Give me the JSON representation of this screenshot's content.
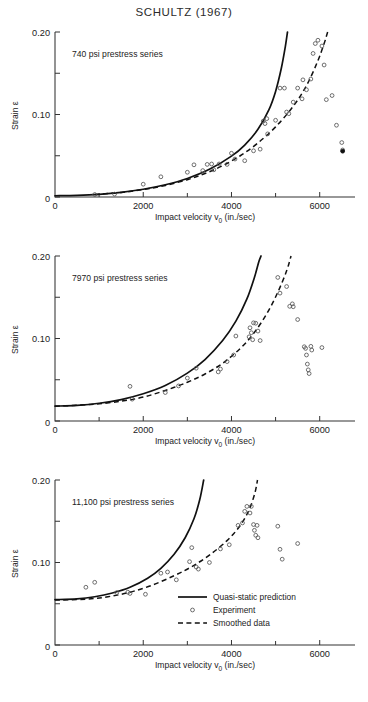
{
  "figure": {
    "title": "SCHULTZ (1967)"
  },
  "axes": {
    "xlabel": "Impact velocity v",
    "xlabel_sub": "0",
    "xlabel_units": "(in./sec)",
    "ylabel": "Strain ε",
    "x_ticks": [
      0,
      2000,
      4000,
      6000
    ],
    "x_tick_labels": [
      "0",
      "2000",
      "4000",
      "6000"
    ],
    "x_minor_ticks": [
      1000,
      3000,
      5000
    ],
    "xlim": [
      0,
      6800
    ],
    "y_ticks": [
      0,
      0.05,
      0.1,
      0.15,
      0.2
    ],
    "y_tick_labels": [
      "0",
      "",
      "0.10",
      "",
      "0.20"
    ],
    "ylim": [
      0,
      0.2
    ]
  },
  "legend": {
    "position": "lower-right-panel-3",
    "entries": [
      {
        "label": "Quasi-static prediction",
        "marker": "solid-line"
      },
      {
        "label": "Experiment",
        "marker": "circle"
      },
      {
        "label": "Smoothed data",
        "marker": "dashed-line"
      }
    ]
  },
  "chart_data": {
    "type": "scatter",
    "title": "SCHULTZ (1967)",
    "xlabel": "Impact velocity v0 (in./sec)",
    "ylabel": "Strain ε",
    "xlim": [
      0,
      6800
    ],
    "ylim": [
      0,
      0.2
    ],
    "grid": false,
    "panels": [
      {
        "label": "740 psi prestress series",
        "prestress_psi": 740,
        "series": [
          {
            "name": "Quasi-static prediction",
            "type": "line",
            "style": "solid",
            "points": [
              [
                0,
                0.0015
              ],
              [
                500,
                0.002
              ],
              [
                1000,
                0.0033
              ],
              [
                1500,
                0.0057
              ],
              [
                2000,
                0.0094
              ],
              [
                2500,
                0.0148
              ],
              [
                3000,
                0.0225
              ],
              [
                3500,
                0.0335
              ],
              [
                4000,
                0.0495
              ],
              [
                4300,
                0.063
              ],
              [
                4600,
                0.082
              ],
              [
                4850,
                0.106
              ],
              [
                5000,
                0.128
              ],
              [
                5130,
                0.156
              ],
              [
                5220,
                0.182
              ],
              [
                5270,
                0.2
              ]
            ]
          },
          {
            "name": "Smoothed data",
            "type": "line",
            "style": "dashed",
            "points": [
              [
                900,
                0.003
              ],
              [
                1500,
                0.0055
              ],
              [
                2000,
                0.009
              ],
              [
                2500,
                0.014
              ],
              [
                3000,
                0.021
              ],
              [
                3400,
                0.0285
              ],
              [
                3800,
                0.038
              ],
              [
                4200,
                0.05
              ],
              [
                4600,
                0.0655
              ],
              [
                5000,
                0.085
              ],
              [
                5400,
                0.11
              ],
              [
                5700,
                0.135
              ],
              [
                5950,
                0.164
              ],
              [
                6100,
                0.186
              ],
              [
                6180,
                0.2
              ]
            ]
          },
          {
            "name": "Experiment",
            "type": "scatter",
            "points": [
              [
                900,
                0.003
              ],
              [
                1350,
                0.0035
              ],
              [
                2000,
                0.0155
              ],
              [
                2400,
                0.0245
              ],
              [
                3000,
                0.03
              ],
              [
                3150,
                0.039
              ],
              [
                3350,
                0.032
              ],
              [
                3450,
                0.0395
              ],
              [
                3550,
                0.04
              ],
              [
                3600,
                0.033
              ],
              [
                3720,
                0.04
              ],
              [
                3900,
                0.0395
              ],
              [
                4000,
                0.053
              ],
              [
                4080,
                0.046
              ],
              [
                4300,
                0.044
              ],
              [
                4500,
                0.056
              ],
              [
                4650,
                0.058
              ],
              [
                4720,
                0.092
              ],
              [
                4760,
                0.089
              ],
              [
                4800,
                0.095
              ],
              [
                4820,
                0.0765
              ],
              [
                5000,
                0.093
              ],
              [
                5100,
                0.132
              ],
              [
                5200,
                0.132
              ],
              [
                5250,
                0.103
              ],
              [
                5300,
                0.101
              ],
              [
                5400,
                0.115
              ],
              [
                5500,
                0.132
              ],
              [
                5600,
                0.119
              ],
              [
                5620,
                0.142
              ],
              [
                5700,
                0.13
              ],
              [
                5800,
                0.143
              ],
              [
                5850,
                0.174
              ],
              [
                5900,
                0.186
              ],
              [
                5960,
                0.19
              ],
              [
                6050,
                0.183
              ],
              [
                6100,
                0.16
              ],
              [
                6150,
                0.118
              ],
              [
                6280,
                0.123
              ],
              [
                6380,
                0.087
              ],
              [
                6500,
                0.066
              ],
              [
                6520,
                0.057
              ]
            ]
          },
          {
            "name": "Experiment (filled)",
            "type": "scatter-filled",
            "points": [
              [
                6520,
                0.0555
              ]
            ]
          }
        ]
      },
      {
        "label": "7970 psi prestress series",
        "prestress_psi": 7970,
        "series": [
          {
            "name": "Quasi-static prediction",
            "type": "line",
            "style": "solid",
            "points": [
              [
                0,
                0.018
              ],
              [
                500,
                0.019
              ],
              [
                1000,
                0.0215
              ],
              [
                1500,
                0.026
              ],
              [
                2000,
                0.033
              ],
              [
                2500,
                0.043
              ],
              [
                3000,
                0.058
              ],
              [
                3400,
                0.0745
              ],
              [
                3800,
                0.0975
              ],
              [
                4100,
                0.121
              ],
              [
                4350,
                0.148
              ],
              [
                4520,
                0.174
              ],
              [
                4620,
                0.193
              ],
              [
                4670,
                0.2
              ]
            ]
          },
          {
            "name": "Smoothed data",
            "type": "line",
            "style": "dashed",
            "points": [
              [
                0,
                0.018
              ],
              [
                800,
                0.02
              ],
              [
                1500,
                0.024
              ],
              [
                2000,
                0.029
              ],
              [
                2500,
                0.037
              ],
              [
                3000,
                0.047
              ],
              [
                3400,
                0.057
              ],
              [
                3800,
                0.07
              ],
              [
                4200,
                0.088
              ],
              [
                4500,
                0.106
              ],
              [
                4800,
                0.13
              ],
              [
                5050,
                0.156
              ],
              [
                5250,
                0.182
              ],
              [
                5350,
                0.2
              ]
            ]
          },
          {
            "name": "Experiment",
            "type": "scatter",
            "points": [
              [
                1700,
                0.042
              ],
              [
                1750,
                0.0265
              ],
              [
                2500,
                0.0345
              ],
              [
                2800,
                0.0425
              ],
              [
                3000,
                0.052
              ],
              [
                3200,
                0.064
              ],
              [
                3700,
                0.0595
              ],
              [
                3750,
                0.063
              ],
              [
                3900,
                0.072
              ],
              [
                4050,
                0.08
              ],
              [
                4100,
                0.103
              ],
              [
                4400,
                0.102
              ],
              [
                4420,
                0.113
              ],
              [
                4450,
                0.107
              ],
              [
                4480,
                0.0985
              ],
              [
                4500,
                0.119
              ],
              [
                4550,
                0.1185
              ],
              [
                4600,
                0.109
              ],
              [
                4650,
                0.0975
              ],
              [
                5050,
                0.174
              ],
              [
                5100,
                0.155
              ],
              [
                5250,
                0.163
              ],
              [
                5320,
                0.139
              ],
              [
                5380,
                0.142
              ],
              [
                5400,
                0.1385
              ],
              [
                5500,
                0.123
              ],
              [
                5650,
                0.09
              ],
              [
                5680,
                0.088
              ],
              [
                5700,
                0.08
              ],
              [
                5720,
                0.069
              ],
              [
                5740,
                0.062
              ],
              [
                5760,
                0.0575
              ],
              [
                5800,
                0.0905
              ],
              [
                5820,
                0.086
              ],
              [
                6050,
                0.089
              ]
            ]
          }
        ]
      },
      {
        "label": "11,100 psi prestress series",
        "prestress_psi": 11100,
        "series": [
          {
            "name": "Quasi-static prediction",
            "type": "line",
            "style": "solid",
            "points": [
              [
                0,
                0.055
              ],
              [
                500,
                0.056
              ],
              [
                900,
                0.0585
              ],
              [
                1300,
                0.063
              ],
              [
                1700,
                0.07
              ],
              [
                2100,
                0.081
              ],
              [
                2400,
                0.093
              ],
              [
                2700,
                0.11
              ],
              [
                2950,
                0.13
              ],
              [
                3150,
                0.153
              ],
              [
                3280,
                0.176
              ],
              [
                3370,
                0.2
              ]
            ]
          },
          {
            "name": "Smoothed data",
            "type": "line",
            "style": "dashed",
            "points": [
              [
                0,
                0.0545
              ],
              [
                700,
                0.0555
              ],
              [
                1200,
                0.0585
              ],
              [
                1700,
                0.064
              ],
              [
                2200,
                0.0725
              ],
              [
                2700,
                0.084
              ],
              [
                3100,
                0.095
              ],
              [
                3500,
                0.109
              ],
              [
                3900,
                0.1265
              ],
              [
                4200,
                0.145
              ],
              [
                4400,
                0.164
              ],
              [
                4530,
                0.184
              ],
              [
                4590,
                0.2
              ]
            ]
          },
          {
            "name": "Experiment",
            "type": "scatter",
            "points": [
              [
                700,
                0.07
              ],
              [
                900,
                0.076
              ],
              [
                1400,
                0.0635
              ],
              [
                1650,
                0.064
              ],
              [
                1700,
                0.0625
              ],
              [
                2050,
                0.0615
              ],
              [
                2400,
                0.087
              ],
              [
                2550,
                0.0885
              ],
              [
                2750,
                0.079
              ],
              [
                3050,
                0.101
              ],
              [
                3100,
                0.118
              ],
              [
                3200,
                0.0945
              ],
              [
                3250,
                0.092
              ],
              [
                3500,
                0.1
              ],
              [
                3750,
                0.1165
              ],
              [
                3950,
                0.1215
              ],
              [
                4150,
                0.145
              ],
              [
                4250,
                0.148
              ],
              [
                4300,
                0.162
              ],
              [
                4350,
                0.168
              ],
              [
                4420,
                0.16
              ],
              [
                4450,
                0.168
              ],
              [
                4500,
                0.146
              ],
              [
                4520,
                0.139
              ],
              [
                4550,
                0.133
              ],
              [
                4580,
                0.145
              ],
              [
                4600,
                0.13
              ],
              [
                5050,
                0.144
              ],
              [
                5100,
                0.116
              ],
              [
                5150,
                0.104
              ],
              [
                5500,
                0.123
              ]
            ]
          }
        ]
      }
    ]
  }
}
